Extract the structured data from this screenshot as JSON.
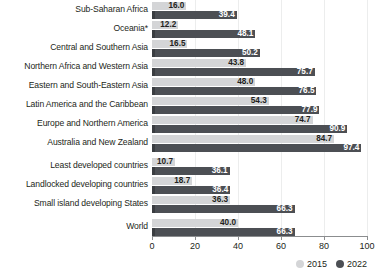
{
  "chart_data": {
    "type": "bar",
    "orientation": "horizontal",
    "title": "",
    "subtitle": "",
    "xlabel": "",
    "ylabel": "",
    "xlim": [
      0,
      100
    ],
    "xticks": [
      "0",
      "20",
      "40",
      "60",
      "80",
      "100"
    ],
    "grid": true,
    "legend_position": "bottom-right",
    "categories": [
      "Sub-Saharan Africa",
      "Oceania*",
      "Central and Southern Asia",
      "Northern Africa and Western Asia",
      "Eastern and South-Eastern Asia",
      "Latin America and the Caribbean",
      "Europe and Northern America",
      "Australia and New Zealand",
      "Least developed countries",
      "Landlocked developing countries",
      "Small island developing States",
      "World"
    ],
    "series": [
      {
        "name": "2015",
        "color": "#d4d5d7",
        "values": [
          16.0,
          12.2,
          16.5,
          43.8,
          48.0,
          54.3,
          74.7,
          84.7,
          10.7,
          18.7,
          36.3,
          40.0
        ]
      },
      {
        "name": "2022",
        "color": "#4c4f54",
        "values": [
          39.4,
          48.1,
          50.2,
          75.7,
          76.5,
          77.9,
          90.9,
          97.4,
          36.1,
          36.4,
          66.3,
          66.3
        ]
      }
    ],
    "value_labels": {
      "2015": [
        "16.0",
        "12.2",
        "16.5",
        "43.8",
        "48.0",
        "54.3",
        "74.7",
        "84.7",
        "10.7",
        "18.7",
        "36.3",
        "40.0"
      ],
      "2022": [
        "39.4",
        "48.1",
        "50.2",
        "75.7",
        "76.5",
        "77.9",
        "90.9",
        "97.4",
        "36.1",
        "36.4",
        "66.3",
        "66.3"
      ]
    }
  },
  "legend": {
    "items": [
      {
        "label": "2015"
      },
      {
        "label": "2022"
      }
    ]
  },
  "axis": {
    "ticks": [
      {
        "label": "0",
        "value": 0
      },
      {
        "label": "20",
        "value": 20
      },
      {
        "label": "40",
        "value": 40
      },
      {
        "label": "60",
        "value": 60
      },
      {
        "label": "80",
        "value": 80
      },
      {
        "label": "100",
        "value": 100
      }
    ]
  }
}
